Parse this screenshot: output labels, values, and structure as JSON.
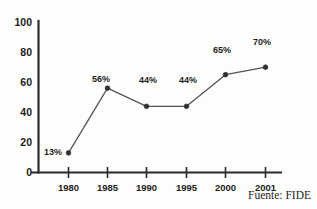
{
  "chart_data": {
    "type": "line",
    "title": "",
    "subtitle": "",
    "xlabel": "",
    "ylabel": "",
    "categories": [
      "1980",
      "1985",
      "1990",
      "1995",
      "2000",
      "2001"
    ],
    "values": [
      13,
      56,
      44,
      44,
      65,
      70
    ],
    "point_labels": [
      "13%",
      "56%",
      "44%",
      "44%",
      "65%",
      "70%"
    ],
    "series": [
      {
        "name": "",
        "values": [
          13,
          56,
          44,
          44,
          65,
          70
        ]
      }
    ],
    "ylim": [
      0,
      100
    ],
    "yticks": [
      0,
      20,
      40,
      60,
      80,
      100
    ],
    "ytick_labels": [
      "0",
      "20",
      "40",
      "60",
      "80",
      "100"
    ],
    "xtick_labels": [
      "1980",
      "1985",
      "1990",
      "1995",
      "2000",
      "2001"
    ],
    "grid": false,
    "legend": false,
    "legend_position": "none",
    "annotations": [
      "Fuente: FIDE"
    ],
    "marker": "circle",
    "line_color": "#555457",
    "marker_color": "#2f2f31",
    "axis_color": "#2b2b2b",
    "background_color": "#fdfdfc",
    "text_color": "#1d1d1d"
  },
  "footer": {
    "source_note": "Fuente: FIDE"
  }
}
